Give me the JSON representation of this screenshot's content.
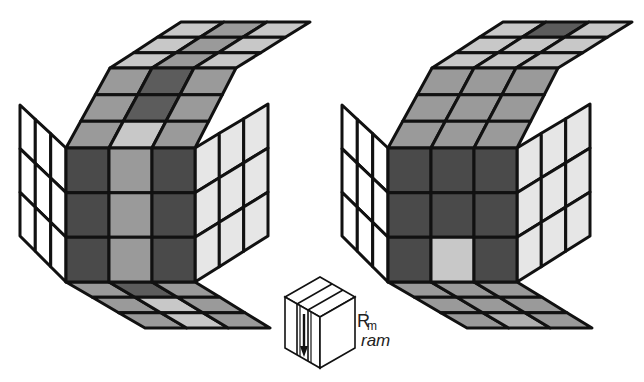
{
  "figure": {
    "move_label": {
      "letter": "R",
      "prime": "′",
      "subscript": "m",
      "name": "ram"
    },
    "colors": {
      "outline": "#111111",
      "white": "#ffffff",
      "light": "#e6e6e6",
      "pale": "#c8c8c8",
      "mid": "#9a9a9a",
      "midlight": "#b0b0b0",
      "dark": "#5c5c5c",
      "darker": "#4a4a4a"
    },
    "cubes": [
      {
        "id": "before",
        "offset_x": 0,
        "front": [
          [
            "darker",
            "mid",
            "darker"
          ],
          [
            "darker",
            "mid",
            "darker"
          ],
          [
            "darker",
            "mid",
            "darker"
          ]
        ],
        "top_lower": [
          [
            "mid",
            "dark",
            "mid"
          ],
          [
            "mid",
            "dark",
            "mid"
          ],
          [
            "mid",
            "pale",
            "mid"
          ]
        ],
        "top_upper": [
          [
            "pale",
            "mid",
            "pale"
          ],
          [
            "pale",
            "mid",
            "pale"
          ],
          [
            "pale",
            "mid",
            "pale"
          ]
        ],
        "left": [
          [
            "white",
            "white",
            "white"
          ],
          [
            "white",
            "white",
            "white"
          ],
          [
            "white",
            "white",
            "white"
          ]
        ],
        "right": [
          [
            "light",
            "light",
            "light"
          ],
          [
            "light",
            "light",
            "light"
          ],
          [
            "light",
            "light",
            "light"
          ]
        ],
        "bottom": [
          [
            "mid",
            "dark",
            "mid"
          ],
          [
            "mid",
            "pale",
            "mid"
          ],
          [
            "mid",
            "pale",
            "mid"
          ]
        ]
      },
      {
        "id": "after",
        "offset_x": 322,
        "front": [
          [
            "darker",
            "darker",
            "darker"
          ],
          [
            "darker",
            "darker",
            "darker"
          ],
          [
            "darker",
            "pale",
            "darker"
          ]
        ],
        "top_lower": [
          [
            "mid",
            "mid",
            "mid"
          ],
          [
            "mid",
            "mid",
            "mid"
          ],
          [
            "mid",
            "mid",
            "mid"
          ]
        ],
        "top_upper": [
          [
            "pale",
            "dark",
            "pale"
          ],
          [
            "pale",
            "pale",
            "pale"
          ],
          [
            "pale",
            "pale",
            "pale"
          ]
        ],
        "left": [
          [
            "white",
            "white",
            "white"
          ],
          [
            "white",
            "white",
            "white"
          ],
          [
            "white",
            "white",
            "white"
          ]
        ],
        "right": [
          [
            "light",
            "light",
            "light"
          ],
          [
            "light",
            "light",
            "light"
          ],
          [
            "light",
            "light",
            "light"
          ]
        ],
        "bottom": [
          [
            "mid",
            "mid",
            "mid"
          ],
          [
            "mid",
            "mid",
            "mid"
          ],
          [
            "mid",
            "midlight",
            "mid"
          ]
        ]
      }
    ]
  }
}
